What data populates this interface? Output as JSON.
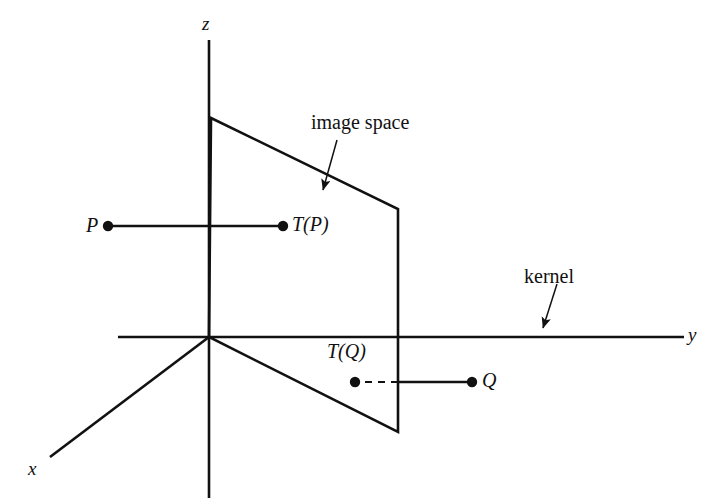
{
  "figure": {
    "background_color": "#ffffff",
    "stroke_color": "#111111",
    "width": 709,
    "height": 498
  },
  "axes": {
    "z": {
      "label": "z",
      "name": "z-axis"
    },
    "y": {
      "label": "y",
      "name": "y-axis"
    },
    "x": {
      "label": "x",
      "name": "x-axis"
    }
  },
  "points": {
    "P": {
      "label": "P",
      "name": "point-P"
    },
    "TP": {
      "label": "T(P)",
      "name": "point-T-of-P"
    },
    "Q": {
      "label": "Q",
      "name": "point-Q"
    },
    "TQ": {
      "label": "T(Q)",
      "name": "point-T-of-Q"
    }
  },
  "annotations": {
    "image_space": {
      "label": "image space",
      "name": "image-space-annotation"
    },
    "kernel": {
      "label": "kernel",
      "name": "kernel-annotation"
    }
  },
  "geometry": {
    "origin": [
      209,
      337
    ],
    "z_axis": [
      [
        209,
        40
      ],
      [
        209,
        498
      ]
    ],
    "y_axis": [
      [
        118,
        337
      ],
      [
        684,
        337
      ]
    ],
    "x_axis": [
      [
        209,
        337
      ],
      [
        50,
        457
      ]
    ],
    "plane_vertices": [
      [
        211,
        118
      ],
      [
        398,
        209
      ],
      [
        398,
        432
      ],
      [
        209,
        337
      ]
    ],
    "segment_P_to_TP": [
      [
        108,
        226
      ],
      [
        283,
        226
      ]
    ],
    "segment_Q_to_plane": [
      [
        472,
        382
      ],
      [
        398,
        382
      ]
    ],
    "dashed_TQ_to_plane": [
      [
        398,
        382
      ],
      [
        355,
        382
      ]
    ],
    "image_space_arrow": [
      [
        336,
        140
      ],
      [
        322,
        193
      ]
    ],
    "kernel_arrow": [
      [
        556,
        284
      ],
      [
        542,
        331
      ]
    ]
  }
}
